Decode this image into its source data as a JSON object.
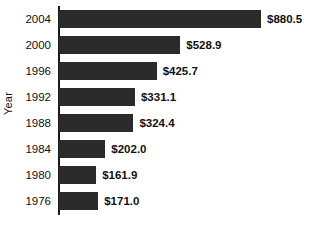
{
  "chart_data": {
    "type": "bar",
    "orientation": "horizontal",
    "title": "",
    "xlabel": "",
    "ylabel": "Year",
    "categories": [
      "2004",
      "2000",
      "1996",
      "1992",
      "1988",
      "1984",
      "1980",
      "1976"
    ],
    "values": [
      880.5,
      528.9,
      425.7,
      331.1,
      324.4,
      202.0,
      161.9,
      171.0
    ],
    "value_labels": [
      "$880.5",
      "$528.9",
      "$425.7",
      "$331.1",
      "$324.4",
      "$202.0",
      "$161.9",
      "$171.0"
    ],
    "xlim": [
      0,
      880.5
    ],
    "grid": false,
    "legend": null,
    "bar_color": "#2b2b2b",
    "background_color": "#ffffff",
    "axis_color": "#1a1a1a"
  },
  "axis": {
    "y_title": "Year"
  },
  "bars": [
    {
      "category": "2004",
      "value": 880.5,
      "label": "$880.5"
    },
    {
      "category": "2000",
      "value": 528.9,
      "label": "$528.9"
    },
    {
      "category": "1996",
      "value": 425.7,
      "label": "$425.7"
    },
    {
      "category": "1992",
      "value": 331.1,
      "label": "$331.1"
    },
    {
      "category": "1988",
      "value": 324.4,
      "label": "$324.4"
    },
    {
      "category": "1984",
      "value": 202.0,
      "label": "$202.0"
    },
    {
      "category": "1980",
      "value": 161.9,
      "label": "$161.9"
    },
    {
      "category": "1976",
      "value": 171.0,
      "label": "$171.0"
    }
  ]
}
